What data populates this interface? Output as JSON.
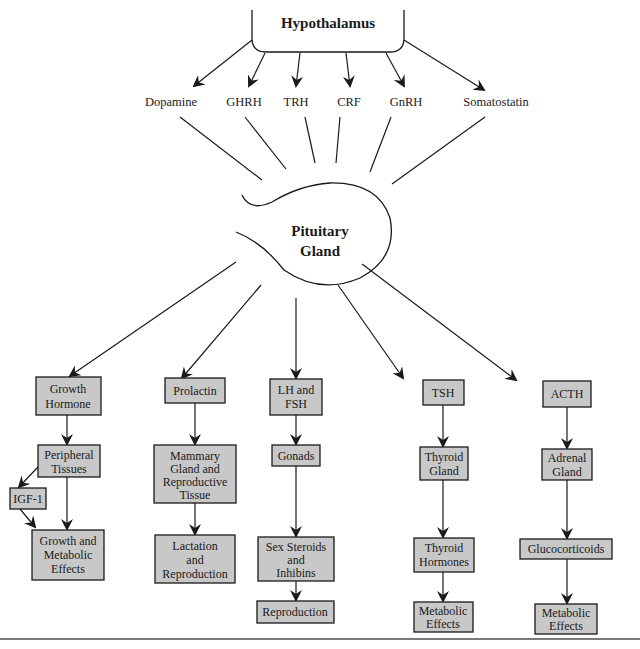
{
  "diagram": {
    "title": "Hypothalamus",
    "center": {
      "line1": "Pituitary",
      "line2": "Gland"
    },
    "box_fill": "#c8c8c8",
    "line_color": "#1a1a1a",
    "hypothalamic_hormones": [
      "Dopamine",
      "GHRH",
      "TRH",
      "CRF",
      "GnRH",
      "Somatostatin"
    ],
    "pituitary_hormones": [
      {
        "hormone": [
          "Growth",
          "Hormone"
        ],
        "chain": [
          [
            "Peripheral",
            "Tissues"
          ],
          [
            "Growth and",
            "Metabolic",
            "Effects"
          ]
        ],
        "side_branch": [
          "IGF-1"
        ]
      },
      {
        "hormone": [
          "Prolactin"
        ],
        "chain": [
          [
            "Mammary",
            "Gland and",
            "Reproductive",
            "Tissue"
          ],
          [
            "Lactation",
            "and",
            "Reproduction"
          ]
        ]
      },
      {
        "hormone": [
          "LH and",
          "FSH"
        ],
        "chain": [
          [
            "Gonads"
          ],
          [
            "Sex Steroids",
            "and",
            "Inhibins"
          ],
          [
            "Reproduction"
          ]
        ]
      },
      {
        "hormone": [
          "TSH"
        ],
        "chain": [
          [
            "Thyroid",
            "Gland"
          ],
          [
            "Thyroid",
            "Hormones"
          ],
          [
            "Metabolic",
            "Effects"
          ]
        ]
      },
      {
        "hormone": [
          "ACTH"
        ],
        "chain": [
          [
            "Adrenal",
            "Gland"
          ],
          [
            "Glucocorticoids"
          ],
          [
            "Metabolic",
            "Effects"
          ]
        ]
      }
    ]
  }
}
